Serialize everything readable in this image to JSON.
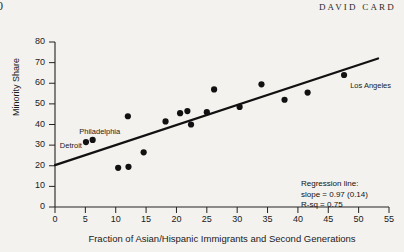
{
  "header": {
    "page_number": "0",
    "running_title": "DAVID CARD"
  },
  "chart_data": {
    "type": "scatter",
    "title": "",
    "xlabel": "Fraction of Asian/Hispanic Immigrants and Second Generations",
    "ylabel": "Minority Share",
    "xlim": [
      0,
      55
    ],
    "ylim": [
      0,
      80
    ],
    "xticks": [
      0,
      5,
      10,
      15,
      20,
      25,
      30,
      35,
      40,
      45,
      50,
      55
    ],
    "yticks": [
      0,
      10,
      20,
      30,
      40,
      50,
      60,
      70,
      80
    ],
    "grid": false,
    "legend": null,
    "marker_color": "#111111",
    "line_color": "#111111",
    "points": [
      {
        "x": 5.1,
        "y": 31.5,
        "label": "Detroit"
      },
      {
        "x": 6.2,
        "y": 32.5,
        "label": "Philadelphia"
      },
      {
        "x": 10.4,
        "y": 19.0,
        "label": ""
      },
      {
        "x": 12.1,
        "y": 19.5,
        "label": ""
      },
      {
        "x": 12.0,
        "y": 44.0,
        "label": ""
      },
      {
        "x": 14.6,
        "y": 26.5,
        "label": ""
      },
      {
        "x": 18.2,
        "y": 41.5,
        "label": ""
      },
      {
        "x": 20.6,
        "y": 45.5,
        "label": ""
      },
      {
        "x": 21.8,
        "y": 46.5,
        "label": ""
      },
      {
        "x": 22.4,
        "y": 40.0,
        "label": ""
      },
      {
        "x": 25.0,
        "y": 46.0,
        "label": ""
      },
      {
        "x": 26.2,
        "y": 57.0,
        "label": ""
      },
      {
        "x": 30.4,
        "y": 48.5,
        "label": ""
      },
      {
        "x": 34.0,
        "y": 59.5,
        "label": ""
      },
      {
        "x": 37.8,
        "y": 52.0,
        "label": ""
      },
      {
        "x": 41.6,
        "y": 55.5,
        "label": ""
      },
      {
        "x": 47.6,
        "y": 64.0,
        "label": "Los Angeles"
      }
    ],
    "point_labels": [
      {
        "text": "Philadelphia",
        "x": 4.0,
        "y": 36.5
      },
      {
        "text": "Detroit",
        "x": 0.8,
        "y": 29.5
      },
      {
        "text": "Los Angeles",
        "x": 48.6,
        "y": 58.5
      }
    ],
    "regression_line": {
      "x_start": 0,
      "y_start": 20.3,
      "x_end": 53.2,
      "y_end": 72.0,
      "slope": 0.97,
      "slope_se": 0.14,
      "r_squared": 0.75
    },
    "annotation": {
      "line1": "Regression line:",
      "line2": "slope = 0.97 (0.14)",
      "line3": "R-sq = 0.75"
    }
  }
}
